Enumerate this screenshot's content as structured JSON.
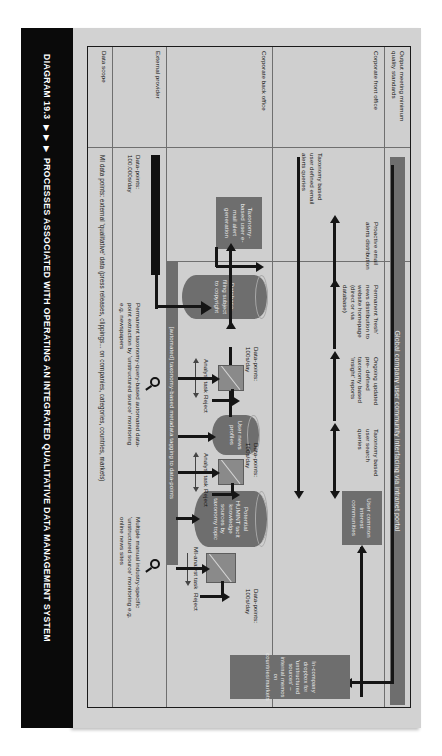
{
  "caption": {
    "number": "DIAGRAM 19.3",
    "arrows": "▶ ▶ ▶",
    "title": "PROCESSES ASSOCIATED WITH OPERATING AN INTEGRATED QUALITATIVE DATA MANAGEMENT SYSTEM"
  },
  "lanes": [
    {
      "id": "output-quality",
      "label": "Output meeting minimum quality standards"
    },
    {
      "id": "front-office",
      "label": "Corporate front office"
    },
    {
      "id": "back-office",
      "label": "Corporate back office"
    },
    {
      "id": "external",
      "label": "External provider"
    },
    {
      "id": "data-scope",
      "label": "Data scope"
    }
  ],
  "portal_bar": {
    "label": "Global company user community interfacing via intranet portal"
  },
  "metadata_bar": {
    "label": "[automated] taxonomy-based metadata tagging to data-points"
  },
  "nodes": {
    "user_communities": {
      "label": "User common interest communities"
    },
    "huminт_sources": {
      "label": "Potential HUMINT tacit knowledge sources by taxonomy topic"
    },
    "user_news_profiles": {
      "label": "User news profiles"
    },
    "database": {
      "label": "Database- filing subject to copyright"
    },
    "email_alert_gen": {
      "label": "Taxonomy-based user e-mail alert generation"
    },
    "dropbox": {
      "label": "In-company dropbox for 'unstructured sources' – internal memos on countries/markets"
    }
  },
  "flow_labels": {
    "search_queries": "Taxonomy based user search queries",
    "insight_reports": "Ongoing updated pre- defined taxonomy based 'insight' reports",
    "news_distribution": "Permanent 'fresh' news distribution to website homepage (direct or via database)",
    "email_alerts": "Proactive email alerts distribution",
    "email_queries": "Taxonomy based user defined email alerts queries"
  },
  "annotations": {
    "analyst_task": "Analyst task",
    "mi_analyst_task": "MI-analyst task",
    "reject": "Reject",
    "data_points_100": "Data-points: 100s/day",
    "data_points_100k": "Data-points: 100.000s/day",
    "manual_monitoring": "Multiple manual industry-specific 'unstructured source' monitoring e.g. online news sites",
    "automated_extraction": "Permanent taxonomy-query-based automated data-point extraction by 'unstructured source' monitoring e.g. newspapers",
    "data_scope_text": "MI data points: external 'qualitative' data (press releases, clippings... on companies, categories, countries, markets)"
  },
  "colors": {
    "sheet_bg": "#d2d2d2",
    "frame_bg": "#cfcfcf",
    "node_fill": "#6e6e6e",
    "task_fill": "#8a8a8a",
    "connector": "#151515",
    "caption_bg": "#0a0a0a"
  }
}
